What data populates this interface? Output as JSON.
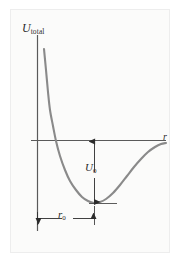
{
  "figure": {
    "kind": "potential-energy-diagram",
    "background_color": "#fbfbfa",
    "border_color": "#ededed",
    "curve_color": "#8a8a8a",
    "axis_color": "#5a5a5a",
    "annotation_color": "#2b2b2b"
  },
  "labels": {
    "y_axis_symbol": "U",
    "y_axis_subscript": "total",
    "x_axis_symbol": "r",
    "depth_symbol": "U",
    "depth_subscript": "0",
    "equilibrium_symbol": "r",
    "equilibrium_subscript": "0"
  },
  "chart_data": {
    "type": "line",
    "title": "",
    "xlabel": "r",
    "ylabel": "U_total",
    "grid": false,
    "legend": null,
    "axis_origin_px": {
      "x": 37,
      "y": 140
    },
    "xlim": [
      0,
      1
    ],
    "ylim": [
      -1,
      1
    ],
    "annotations": [
      {
        "name": "well-depth",
        "label": "U_0",
        "type": "double-headed-vertical-arrow",
        "from_px": {
          "x": 94,
          "y": 140
        },
        "to_px": {
          "x": 94,
          "y": 203
        }
      },
      {
        "name": "equilibrium-separation",
        "label": "r_0",
        "type": "double-headed-horizontal-arrow",
        "from_px": {
          "x": 37,
          "y": 218
        },
        "to_px": {
          "x": 94,
          "y": 218
        }
      },
      {
        "name": "minimum-level-line",
        "label": "",
        "type": "horizontal-tangent-segment",
        "from_px": {
          "x": 89,
          "y": 203
        },
        "to_px": {
          "x": 117,
          "y": 203
        }
      }
    ],
    "series": [
      {
        "name": "U_total(r)",
        "color": "#8a8a8a",
        "points_px": [
          [
            44,
            49
          ],
          [
            46,
            70
          ],
          [
            48,
            92
          ],
          [
            50,
            110
          ],
          [
            53,
            126
          ],
          [
            56,
            141
          ],
          [
            60,
            156
          ],
          [
            65,
            170
          ],
          [
            70,
            181
          ],
          [
            76,
            190
          ],
          [
            82,
            197
          ],
          [
            88,
            201
          ],
          [
            94,
            203
          ],
          [
            100,
            202
          ],
          [
            106,
            199
          ],
          [
            113,
            193
          ],
          [
            120,
            185
          ],
          [
            127,
            176
          ],
          [
            134,
            167
          ],
          [
            141,
            159
          ],
          [
            148,
            152
          ],
          [
            155,
            147
          ],
          [
            161,
            144
          ],
          [
            166,
            143
          ]
        ],
        "zero_crossing_px": {
          "x": 56,
          "y": 140
        },
        "minimum_px": {
          "x": 94,
          "y": 203
        }
      }
    ]
  }
}
